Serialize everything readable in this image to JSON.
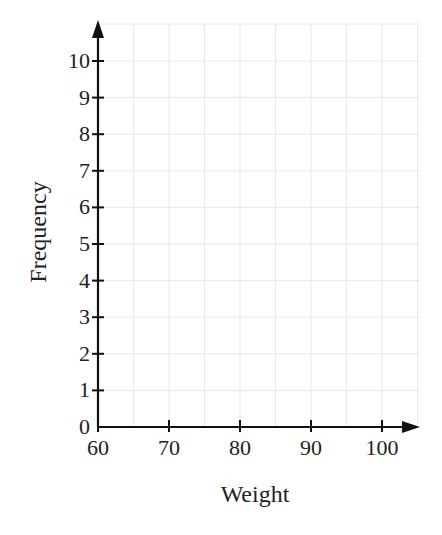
{
  "chart_data": {
    "type": "bar",
    "title": "",
    "xlabel": "Weight",
    "ylabel": "Frequency",
    "xlim": [
      60,
      105
    ],
    "ylim": [
      0,
      10.5
    ],
    "x_ticks": [
      60,
      70,
      80,
      90,
      100
    ],
    "y_ticks": [
      0,
      1,
      2,
      3,
      4,
      5,
      6,
      7,
      8,
      9,
      10
    ],
    "x_grid_step": 5,
    "y_grid_step": 1,
    "grid": true,
    "categories": [],
    "values": [],
    "note": "Empty histogram grid (no data plotted)"
  },
  "colors": {
    "axis": "#111111",
    "grid": "#e8e8e8",
    "text": "#222222"
  }
}
